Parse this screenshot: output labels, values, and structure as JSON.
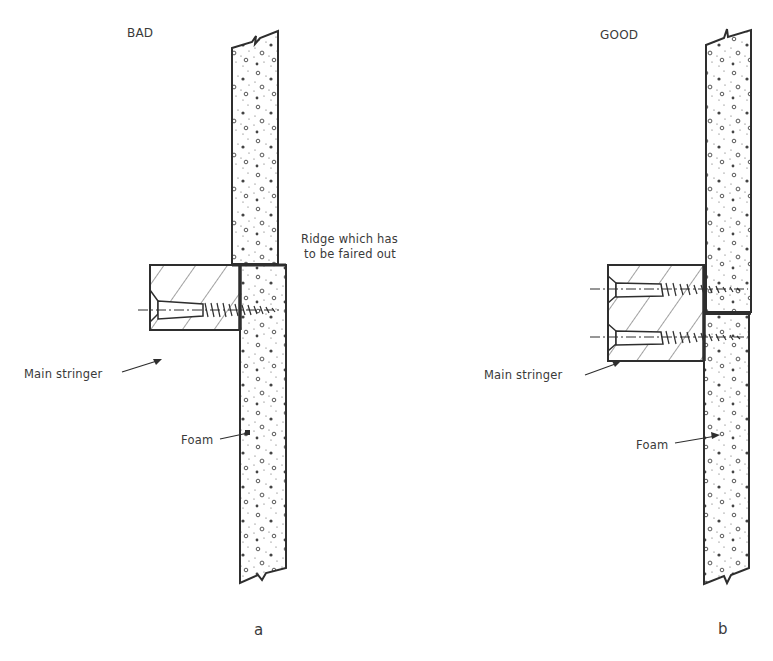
{
  "figure": {
    "panels": [
      {
        "id": "a",
        "title": "BAD",
        "letter": "a",
        "labels": {
          "ridge": [
            "Ridge which has",
            "to be faired out"
          ],
          "stringer": "Main stringer",
          "foam": "Foam"
        }
      },
      {
        "id": "b",
        "title": "GOOD",
        "letter": "b",
        "labels": {
          "stringer": "Main stringer",
          "foam": "Foam"
        }
      }
    ],
    "colors": {
      "line": "#2e2e2e",
      "background": "#ffffff"
    }
  }
}
